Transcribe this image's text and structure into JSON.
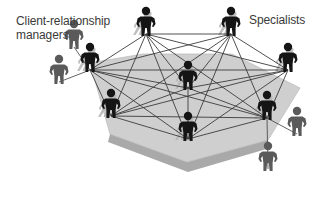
{
  "labels": {
    "crm_line1": "Client-relationship",
    "crm_line2": "managers",
    "specialists": "Specialists"
  },
  "colors": {
    "platform_top": "#cfcfcf",
    "platform_side": "#a9a9a9",
    "platform_edge": "#bcbcbc",
    "network_line": "#3c3c3c",
    "specialist_figure": "#151515",
    "manager_figure": "#5a5a5a",
    "shadow": "#b5b5b5",
    "text": "#3a3a3a"
  },
  "platform": {
    "top_polygon": [
      [
        90,
        63
      ],
      [
        143,
        54
      ],
      [
        232,
        54
      ],
      [
        300,
        88
      ],
      [
        268,
        140
      ],
      [
        187,
        162
      ],
      [
        110,
        134
      ]
    ],
    "side_polygon": [
      [
        110,
        134
      ],
      [
        187,
        162
      ],
      [
        268,
        140
      ],
      [
        270,
        148
      ],
      [
        188,
        172
      ],
      [
        108,
        142
      ]
    ]
  },
  "nodes": [
    {
      "id": "s1",
      "role": "specialist",
      "x": 146,
      "y": 36
    },
    {
      "id": "s2",
      "role": "specialist",
      "x": 231,
      "y": 36
    },
    {
      "id": "s3",
      "role": "specialist",
      "x": 288,
      "y": 72
    },
    {
      "id": "s4",
      "role": "specialist",
      "x": 90,
      "y": 72
    },
    {
      "id": "s5",
      "role": "specialist",
      "x": 188,
      "y": 90
    },
    {
      "id": "s6",
      "role": "specialist",
      "x": 111,
      "y": 118
    },
    {
      "id": "s7",
      "role": "specialist",
      "x": 267,
      "y": 120
    },
    {
      "id": "s8",
      "role": "specialist",
      "x": 188,
      "y": 141
    }
  ],
  "managers": [
    {
      "id": "m1",
      "x": 74,
      "y": 49
    },
    {
      "id": "m2",
      "x": 59,
      "y": 84
    },
    {
      "id": "m3",
      "x": 297,
      "y": 136
    },
    {
      "id": "m4",
      "x": 268,
      "y": 171
    }
  ],
  "edges": [
    [
      "s1",
      "s2"
    ],
    [
      "s1",
      "s3"
    ],
    [
      "s1",
      "s4"
    ],
    [
      "s1",
      "s5"
    ],
    [
      "s1",
      "s6"
    ],
    [
      "s1",
      "s7"
    ],
    [
      "s1",
      "s8"
    ],
    [
      "s2",
      "s3"
    ],
    [
      "s2",
      "s4"
    ],
    [
      "s2",
      "s5"
    ],
    [
      "s2",
      "s6"
    ],
    [
      "s2",
      "s7"
    ],
    [
      "s2",
      "s8"
    ],
    [
      "s3",
      "s4"
    ],
    [
      "s3",
      "s5"
    ],
    [
      "s3",
      "s6"
    ],
    [
      "s3",
      "s7"
    ],
    [
      "s3",
      "s8"
    ],
    [
      "s4",
      "s5"
    ],
    [
      "s4",
      "s6"
    ],
    [
      "s4",
      "s7"
    ],
    [
      "s4",
      "s8"
    ],
    [
      "s5",
      "s6"
    ],
    [
      "s5",
      "s7"
    ],
    [
      "s5",
      "s8"
    ],
    [
      "s6",
      "s7"
    ],
    [
      "s6",
      "s8"
    ],
    [
      "s7",
      "s8"
    ]
  ],
  "manager_links": [
    [
      "m1",
      "s4"
    ],
    [
      "m2",
      "s4"
    ],
    [
      "m3",
      "s7"
    ],
    [
      "m4",
      "s7"
    ]
  ]
}
